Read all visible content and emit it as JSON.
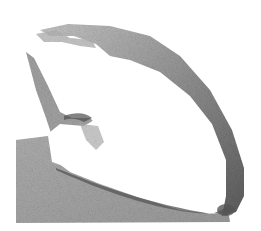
{
  "image": {
    "description": "Grayscale stippled render of a curved shell-like 3D surface",
    "width": 261,
    "height": 231,
    "colors": {
      "background": "#ffffff",
      "ground": "#a8a8a8",
      "surface_dark": "#6a6a6a",
      "surface_mid": "#9a9a9a",
      "surface_light": "#c8c8c8",
      "highlight": "#ffffff"
    }
  }
}
